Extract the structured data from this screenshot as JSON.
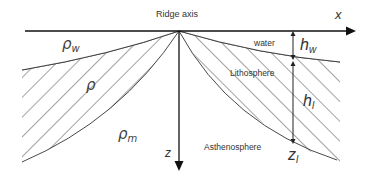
{
  "title": "Ridge axis",
  "axes": {
    "x_label": "x",
    "z_label": "z"
  },
  "regions": {
    "water_label": "water",
    "lithosphere_label": "Lithosphere",
    "asthenosphere_label": "Asthenosphere"
  },
  "densities": {
    "water": {
      "symbol": "ρ",
      "subscript": "w"
    },
    "lithosphere": {
      "symbol": "ρ",
      "subscript": ""
    },
    "mantle": {
      "symbol": "ρ",
      "subscript": "m"
    }
  },
  "dimensions": {
    "water_depth": {
      "symbol": "h",
      "subscript": "w"
    },
    "lithosphere_thickness": {
      "symbol": "h",
      "subscript": "l"
    },
    "lithosphere_base": {
      "symbol": "z",
      "subscript": "l"
    }
  },
  "colors": {
    "line": "#222222",
    "hatch": "#333333",
    "background": "#ffffff"
  }
}
